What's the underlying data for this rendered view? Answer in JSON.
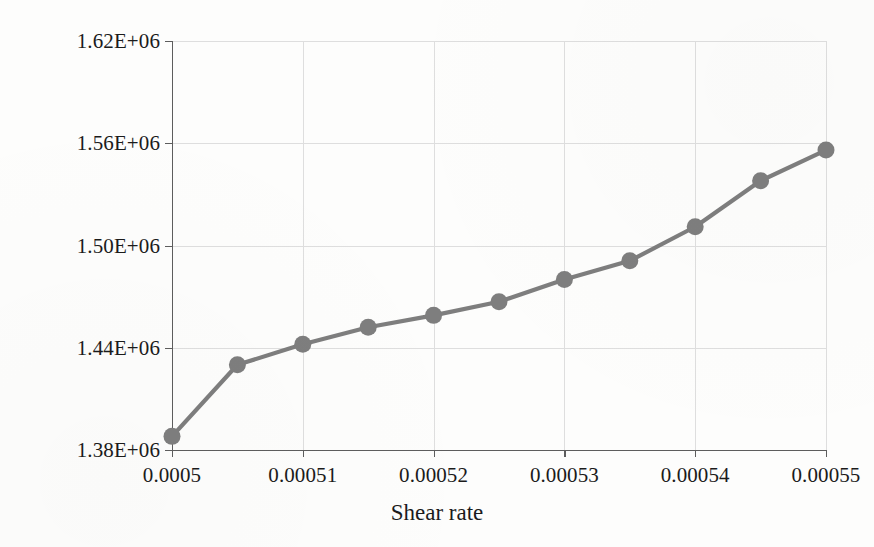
{
  "chart_data": {
    "type": "line",
    "title": "",
    "xlabel": "Shear rate",
    "ylabel": "Stress intensity, MPa",
    "xlim": [
      0.0005,
      0.00055
    ],
    "ylim": [
      1380000,
      1620000
    ],
    "grid": true,
    "legend": "none",
    "marker": "circle",
    "series_color": "#7e7e7e",
    "gridline_color": "#dedede",
    "axis_color": "#5d5d5d",
    "x_tick_labels": [
      "0.0005",
      "0.00051",
      "0.00052",
      "0.00053",
      "0.00054",
      "0.00055"
    ],
    "x_tick_values": [
      0.0005,
      0.00051,
      0.00052,
      0.00053,
      0.00054,
      0.00055
    ],
    "y_tick_labels": [
      "1.38E+06",
      "1.44E+06",
      "1.50E+06",
      "1.56E+06",
      "1.62E+06"
    ],
    "y_tick_values": [
      1380000,
      1440000,
      1500000,
      1560000,
      1620000
    ],
    "x": [
      0.0005,
      0.000505,
      0.00051,
      0.000515,
      0.00052,
      0.000525,
      0.00053,
      0.000535,
      0.00054,
      0.000545,
      0.00055
    ],
    "values": [
      1388000,
      1430000,
      1442000,
      1452000,
      1459000,
      1467000,
      1480000,
      1491000,
      1511000,
      1538000,
      1556000
    ],
    "points": [
      {
        "x": 0.0005,
        "y": 1388000
      },
      {
        "x": 0.000505,
        "y": 1430000
      },
      {
        "x": 0.00051,
        "y": 1442000
      },
      {
        "x": 0.000515,
        "y": 1452000
      },
      {
        "x": 0.00052,
        "y": 1459000
      },
      {
        "x": 0.000525,
        "y": 1467000
      },
      {
        "x": 0.00053,
        "y": 1480000
      },
      {
        "x": 0.000535,
        "y": 1491000
      },
      {
        "x": 0.00054,
        "y": 1511000
      },
      {
        "x": 0.000545,
        "y": 1538000
      },
      {
        "x": 0.00055,
        "y": 1556000
      }
    ]
  }
}
